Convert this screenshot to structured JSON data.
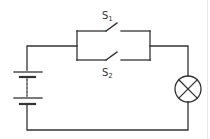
{
  "diagram": {
    "type": "circuit",
    "colors": {
      "wire": "#333333",
      "background": "#ffffff",
      "edge_line": "#e6e9ee"
    },
    "components": {
      "battery": {
        "kind": "multi-cell battery",
        "cells_shown": 2,
        "dotted_link": true
      },
      "switch_1": {
        "label_main": "S",
        "label_sub": "1",
        "state": "open",
        "branch": "top"
      },
      "switch_2": {
        "label_main": "S",
        "label_sub": "2",
        "state": "open",
        "branch": "bottom"
      },
      "lamp": {
        "kind": "lamp",
        "symbol": "circle-with-cross"
      }
    },
    "connections": [
      "battery top -> parallel switch block left node",
      "parallel switch block right node -> lamp top",
      "lamp bottom -> battery bottom"
    ]
  }
}
